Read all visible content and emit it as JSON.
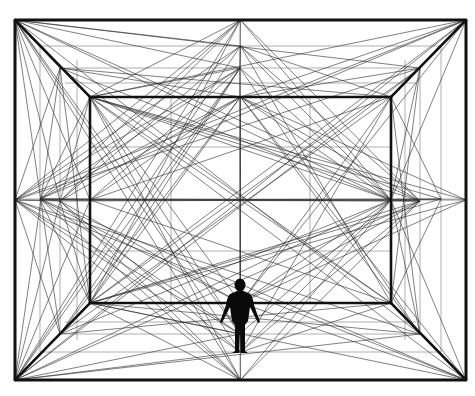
{
  "diagram": {
    "title": "",
    "type": "one-point perspective room construction",
    "colors": {
      "background": "#ffffff",
      "line": "#111111"
    },
    "outer_frame": {
      "x1": 15,
      "y1": 20,
      "x2": 466,
      "y2": 380
    },
    "middle_frame": {
      "x1": 60,
      "y1": 68,
      "x2": 420,
      "y2": 334
    },
    "near_frame": {
      "x1": 40,
      "y1": 46,
      "x2": 441,
      "y2": 352
    },
    "inner_frame": {
      "x1": 90,
      "y1": 97,
      "x2": 391,
      "y2": 303
    },
    "center": {
      "x": 240,
      "y": 199
    },
    "figure": {
      "label": "human-silhouette",
      "head_cx": 240,
      "head_cy": 285,
      "head_r": 5.5,
      "feet_y": 353
    }
  }
}
